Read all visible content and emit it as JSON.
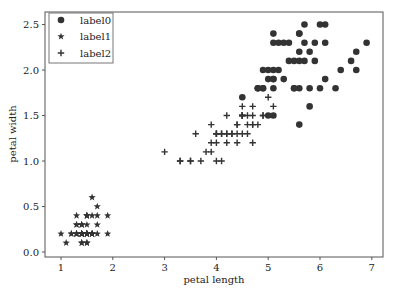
{
  "chart_data": {
    "type": "scatter",
    "title": "",
    "xlabel": "petal length",
    "ylabel": "petal width",
    "xlim": [
      0.7,
      7.2
    ],
    "ylim": [
      -0.05,
      2.65
    ],
    "xticks": [
      "1",
      "2",
      "3",
      "4",
      "5",
      "6",
      "7"
    ],
    "yticks": [
      "0.0",
      "0.5",
      "1.0",
      "1.5",
      "2.0",
      "2.5"
    ],
    "grid": false,
    "legend_position": "upper left",
    "marker_color": "#333333",
    "series": [
      {
        "name": "label0",
        "marker": "circle",
        "points": [
          [
            6.0,
            2.5
          ],
          [
            5.1,
            1.9
          ],
          [
            5.9,
            2.1
          ],
          [
            5.6,
            1.8
          ],
          [
            5.8,
            2.2
          ],
          [
            6.6,
            2.1
          ],
          [
            4.5,
            1.7
          ],
          [
            6.3,
            1.8
          ],
          [
            5.8,
            1.8
          ],
          [
            6.1,
            2.5
          ],
          [
            5.1,
            2.0
          ],
          [
            5.3,
            1.9
          ],
          [
            5.5,
            2.1
          ],
          [
            5.0,
            2.0
          ],
          [
            5.1,
            2.4
          ],
          [
            5.3,
            2.3
          ],
          [
            5.5,
            1.8
          ],
          [
            6.7,
            2.2
          ],
          [
            6.9,
            2.3
          ],
          [
            5.0,
            1.5
          ],
          [
            5.7,
            2.3
          ],
          [
            4.9,
            2.0
          ],
          [
            6.7,
            2.0
          ],
          [
            4.9,
            1.8
          ],
          [
            5.7,
            2.1
          ],
          [
            6.0,
            1.8
          ],
          [
            4.8,
            1.8
          ],
          [
            4.9,
            1.8
          ],
          [
            5.6,
            2.1
          ],
          [
            5.8,
            1.6
          ],
          [
            6.1,
            1.9
          ],
          [
            6.4,
            2.0
          ],
          [
            5.6,
            2.2
          ],
          [
            5.1,
            1.5
          ],
          [
            5.6,
            1.4
          ],
          [
            6.1,
            2.3
          ],
          [
            5.6,
            2.4
          ],
          [
            5.5,
            1.8
          ],
          [
            4.8,
            1.8
          ],
          [
            5.4,
            2.1
          ],
          [
            5.6,
            2.4
          ],
          [
            5.1,
            2.3
          ],
          [
            5.1,
            1.9
          ],
          [
            5.9,
            2.3
          ],
          [
            5.7,
            2.5
          ],
          [
            5.2,
            2.3
          ],
          [
            5.0,
            1.9
          ],
          [
            5.2,
            2.0
          ],
          [
            5.4,
            2.3
          ],
          [
            5.1,
            1.8
          ]
        ]
      },
      {
        "name": "label1",
        "marker": "star",
        "points": [
          [
            1.4,
            0.2
          ],
          [
            1.4,
            0.2
          ],
          [
            1.3,
            0.2
          ],
          [
            1.5,
            0.2
          ],
          [
            1.4,
            0.2
          ],
          [
            1.7,
            0.4
          ],
          [
            1.4,
            0.3
          ],
          [
            1.5,
            0.2
          ],
          [
            1.4,
            0.2
          ],
          [
            1.5,
            0.1
          ],
          [
            1.5,
            0.2
          ],
          [
            1.6,
            0.2
          ],
          [
            1.4,
            0.1
          ],
          [
            1.1,
            0.1
          ],
          [
            1.2,
            0.2
          ],
          [
            1.5,
            0.4
          ],
          [
            1.3,
            0.4
          ],
          [
            1.4,
            0.3
          ],
          [
            1.7,
            0.3
          ],
          [
            1.5,
            0.3
          ],
          [
            1.7,
            0.2
          ],
          [
            1.5,
            0.4
          ],
          [
            1.0,
            0.2
          ],
          [
            1.7,
            0.5
          ],
          [
            1.9,
            0.2
          ],
          [
            1.6,
            0.2
          ],
          [
            1.6,
            0.4
          ],
          [
            1.5,
            0.2
          ],
          [
            1.4,
            0.2
          ],
          [
            1.6,
            0.2
          ],
          [
            1.6,
            0.2
          ],
          [
            1.5,
            0.4
          ],
          [
            1.5,
            0.1
          ],
          [
            1.4,
            0.2
          ],
          [
            1.5,
            0.2
          ],
          [
            1.2,
            0.2
          ],
          [
            1.3,
            0.2
          ],
          [
            1.4,
            0.1
          ],
          [
            1.3,
            0.2
          ],
          [
            1.5,
            0.2
          ],
          [
            1.3,
            0.3
          ],
          [
            1.3,
            0.3
          ],
          [
            1.3,
            0.2
          ],
          [
            1.6,
            0.6
          ],
          [
            1.9,
            0.4
          ],
          [
            1.4,
            0.3
          ],
          [
            1.6,
            0.2
          ],
          [
            1.4,
            0.2
          ],
          [
            1.5,
            0.2
          ],
          [
            1.4,
            0.2
          ]
        ]
      },
      {
        "name": "label2",
        "marker": "plus",
        "points": [
          [
            4.7,
            1.4
          ],
          [
            4.5,
            1.5
          ],
          [
            4.9,
            1.5
          ],
          [
            4.0,
            1.3
          ],
          [
            4.6,
            1.5
          ],
          [
            4.5,
            1.3
          ],
          [
            4.7,
            1.6
          ],
          [
            3.3,
            1.0
          ],
          [
            4.6,
            1.3
          ],
          [
            3.9,
            1.4
          ],
          [
            3.5,
            1.0
          ],
          [
            4.2,
            1.5
          ],
          [
            4.0,
            1.0
          ],
          [
            4.7,
            1.4
          ],
          [
            3.6,
            1.3
          ],
          [
            4.4,
            1.4
          ],
          [
            4.5,
            1.5
          ],
          [
            4.1,
            1.0
          ],
          [
            4.5,
            1.5
          ],
          [
            3.9,
            1.1
          ],
          [
            4.8,
            1.8
          ],
          [
            4.0,
            1.3
          ],
          [
            4.9,
            1.5
          ],
          [
            4.7,
            1.2
          ],
          [
            4.3,
            1.3
          ],
          [
            4.4,
            1.4
          ],
          [
            4.8,
            1.4
          ],
          [
            5.0,
            1.7
          ],
          [
            4.5,
            1.5
          ],
          [
            3.5,
            1.0
          ],
          [
            3.8,
            1.1
          ],
          [
            3.7,
            1.0
          ],
          [
            3.9,
            1.2
          ],
          [
            5.1,
            1.6
          ],
          [
            4.5,
            1.5
          ],
          [
            4.5,
            1.6
          ],
          [
            4.7,
            1.5
          ],
          [
            4.4,
            1.3
          ],
          [
            4.1,
            1.3
          ],
          [
            4.0,
            1.3
          ],
          [
            4.4,
            1.2
          ],
          [
            4.6,
            1.4
          ],
          [
            4.0,
            1.2
          ],
          [
            3.3,
            1.0
          ],
          [
            4.2,
            1.3
          ],
          [
            4.2,
            1.2
          ],
          [
            4.2,
            1.3
          ],
          [
            4.3,
            1.3
          ],
          [
            3.0,
            1.1
          ],
          [
            4.1,
            1.3
          ]
        ]
      }
    ]
  }
}
